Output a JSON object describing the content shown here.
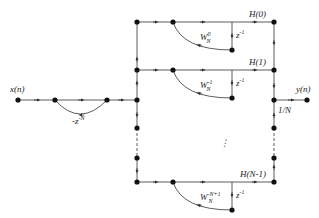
{
  "diagram": {
    "input_label": "x(n)",
    "output_label": "y(n)",
    "comb_gain": "-z",
    "comb_gain_exp": "-N",
    "scale_gain": "1/N",
    "ellipsis": "⋮",
    "branches": [
      {
        "H": "H(0)",
        "delay": "z",
        "delay_exp": "-1",
        "W": "W",
        "W_sub": "N",
        "W_sup": "0"
      },
      {
        "H": "H(1)",
        "delay": "z",
        "delay_exp": "-1",
        "W": "W",
        "W_sub": "N",
        "W_sup": "-1"
      },
      {
        "H": "H(N-1)",
        "delay": "z",
        "delay_exp": "-1",
        "W": "W",
        "W_sub": "N",
        "W_sup": "-N+1"
      }
    ],
    "colors": {
      "line": "#333333",
      "node": "#111111"
    }
  }
}
